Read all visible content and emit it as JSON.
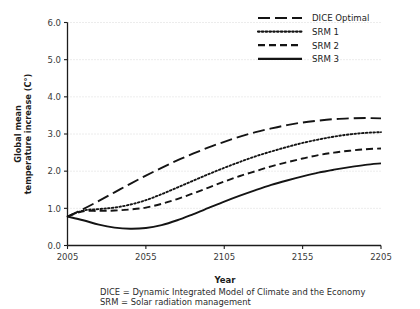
{
  "chart_data": {
    "type": "line",
    "title": "",
    "xlabel": "Year",
    "ylabel": "Global mean temperature increase (C°)",
    "xlim": [
      2005,
      2205
    ],
    "ylim": [
      0.0,
      6.0
    ],
    "grid": true,
    "legend_position": "top-right",
    "xticks": [
      "2005",
      "2055",
      "2105",
      "2155",
      "2205"
    ],
    "xtick_values": [
      2005,
      2055,
      2105,
      2155,
      2205
    ],
    "yticks": [
      "0.0",
      "1.0",
      "2.0",
      "3.0",
      "4.0",
      "5.0",
      "6.0"
    ],
    "ytick_values": [
      0.0,
      1.0,
      2.0,
      3.0,
      4.0,
      5.0,
      6.0
    ],
    "x": [
      2005,
      2015,
      2025,
      2035,
      2045,
      2055,
      2065,
      2075,
      2085,
      2095,
      2105,
      2115,
      2125,
      2135,
      2145,
      2155,
      2165,
      2175,
      2185,
      2195,
      2205
    ],
    "series": [
      {
        "name": "DICE Optimal",
        "dash": "long-dash",
        "values": [
          0.78,
          0.98,
          1.2,
          1.43,
          1.66,
          1.88,
          2.09,
          2.29,
          2.47,
          2.64,
          2.79,
          2.93,
          3.05,
          3.15,
          3.24,
          3.31,
          3.36,
          3.4,
          3.42,
          3.43,
          3.42
        ]
      },
      {
        "name": "SRM 1",
        "dash": "dotted",
        "values": [
          0.78,
          0.94,
          0.98,
          1.02,
          1.1,
          1.22,
          1.38,
          1.56,
          1.74,
          1.92,
          2.09,
          2.25,
          2.4,
          2.53,
          2.65,
          2.76,
          2.85,
          2.93,
          2.99,
          3.03,
          3.05
        ]
      },
      {
        "name": "SRM 2",
        "dash": "dash",
        "values": [
          0.78,
          0.92,
          0.93,
          0.94,
          0.97,
          1.02,
          1.12,
          1.25,
          1.4,
          1.56,
          1.72,
          1.87,
          2.0,
          2.13,
          2.24,
          2.34,
          2.43,
          2.5,
          2.55,
          2.59,
          2.61
        ]
      },
      {
        "name": "SRM 3",
        "dash": "solid",
        "values": [
          0.78,
          0.68,
          0.56,
          0.48,
          0.45,
          0.47,
          0.55,
          0.68,
          0.84,
          1.01,
          1.18,
          1.34,
          1.49,
          1.63,
          1.75,
          1.86,
          1.96,
          2.04,
          2.11,
          2.17,
          2.21
        ]
      }
    ],
    "footnotes": [
      "DICE = Dynamic Integrated Model of Climate and the Economy",
      "SRM = Solar radiation management"
    ],
    "colors": {
      "line": "#141414",
      "grid": "#c9c9c9",
      "axis": "#1c1c1c",
      "background": "#ffffff"
    }
  }
}
